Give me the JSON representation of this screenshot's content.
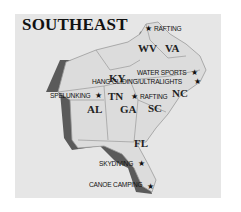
{
  "map": {
    "title": "SOUTHEAST",
    "colors": {
      "background": "#ffffff",
      "panel": "#e6e6e6",
      "land": "#dcdcdc",
      "shadow": "#5a5a5a",
      "border": "#9a9a9a",
      "text": "#111111"
    },
    "states": [
      {
        "abbr": "KY"
      },
      {
        "abbr": "WV"
      },
      {
        "abbr": "VA"
      },
      {
        "abbr": "TN"
      },
      {
        "abbr": "NC"
      },
      {
        "abbr": "SC"
      },
      {
        "abbr": "AL"
      },
      {
        "abbr": "GA"
      },
      {
        "abbr": "FL"
      }
    ],
    "activities": [
      {
        "label": "RAFTING",
        "marker": "★"
      },
      {
        "label": "WATER SPORTS",
        "marker": "★"
      },
      {
        "label": "HANG GLIDING/ULTRALIGHTS",
        "marker": "★"
      },
      {
        "label": "SPELUNKING",
        "marker": "★"
      },
      {
        "label": "RAFTING",
        "marker": "★"
      },
      {
        "label": "SKYDIVING",
        "marker": "★"
      },
      {
        "label": "CANOE CAMPING",
        "marker": "★"
      }
    ]
  }
}
